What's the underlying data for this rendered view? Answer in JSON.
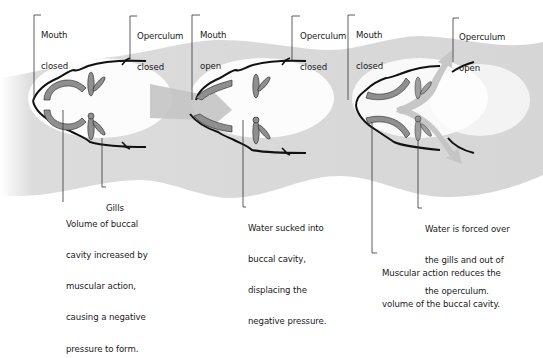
{
  "colors": {
    "water_band": "#d9d9d9",
    "outline": "#111111",
    "muscle_fill": "#8f8f8f",
    "arrow_fill": "#c4c4c4",
    "leader_line": "#333333"
  },
  "stages": [
    {
      "id": "stage-1",
      "labels": {
        "mouth": [
          "Mouth",
          "closed"
        ],
        "operculum": [
          "Operculum",
          "closed"
        ],
        "gills": [
          "Gills"
        ],
        "description": [
          "Volume of buccal",
          "cavity increased by",
          "muscular action,",
          "causing a negative",
          "pressure to form."
        ]
      }
    },
    {
      "id": "stage-2",
      "labels": {
        "mouth": [
          "Mouth",
          "open"
        ],
        "operculum": [
          "Operculum",
          "closed"
        ],
        "description": [
          "Water sucked into",
          "buccal cavity,",
          "displacing the",
          "negative pressure."
        ]
      }
    },
    {
      "id": "stage-3",
      "labels": {
        "mouth": [
          "Mouth",
          "closed"
        ],
        "operculum": [
          "Operculum",
          "open"
        ],
        "description": [
          "Water is forced over",
          "the gills and out of",
          "the operculum."
        ],
        "muscle": [
          "Muscular action reduces the",
          "volume of the buccal cavity."
        ]
      }
    }
  ]
}
